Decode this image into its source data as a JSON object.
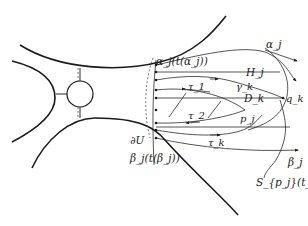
{
  "figure": {
    "type": "mathematical-diagram",
    "labels": {
      "alpha_j_t": "α_j(t(α_j))",
      "H_j": "H_j",
      "gamma_k": "γ_k",
      "tau_1": "τ_1",
      "D_k": "D_k",
      "q_k": "q_k",
      "tau_2": "τ_2",
      "p_j": "p_j",
      "tau_k": "τ_k",
      "dU": "∂U",
      "beta_j_t": "β_j(t(β_j))",
      "alpha_j": "α_j",
      "beta_j": "β_j",
      "S_pj_tk": "S_{p_j}(t_k)"
    },
    "colors": {
      "stroke": "#1a1a1a",
      "background": "#ffffff"
    }
  }
}
